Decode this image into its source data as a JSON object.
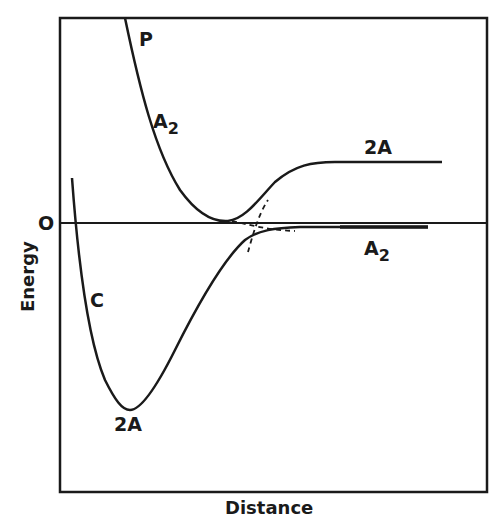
{
  "diagram": {
    "type": "potential-energy-curves",
    "axes": {
      "y_label": "Energy",
      "x_label": "Distance",
      "zero_label": "O"
    },
    "curves": [
      {
        "id": "repulsive",
        "labels": [
          "P",
          "A₂"
        ],
        "dissociates_to": "2A"
      },
      {
        "id": "bound",
        "labels": [
          "C",
          "2A"
        ],
        "dissociates_to": "A₂"
      }
    ],
    "labels": {
      "p": "P",
      "a2_upper_main": "A",
      "a2_upper_sub": "2",
      "twoA_right": "2A",
      "a2_lower_main": "A",
      "a2_lower_sub": "2",
      "c": "C",
      "twoA_bottom": "2A"
    },
    "colors": {
      "ink": "#1a1a1a",
      "background": "#ffffff"
    }
  }
}
